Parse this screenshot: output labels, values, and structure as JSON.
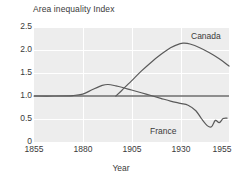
{
  "chart_data": {
    "type": "line",
    "title": "Area inequality Index",
    "xlabel": "Year",
    "ylabel": "Area inequality Index",
    "xlim": [
      1855,
      1955
    ],
    "ylim": [
      0,
      2.5
    ],
    "grid": true,
    "legend_position": "inline-labels",
    "xticks": [
      "1855",
      "1880",
      "1905",
      "1930",
      "1955"
    ],
    "yticks": [
      "2.5",
      "2.0",
      "1.5",
      "1.0",
      "0.5",
      "0"
    ],
    "reference_line": {
      "value": 1.0,
      "label": "1.0"
    },
    "series": [
      {
        "name": "Canada",
        "x": [
          1897,
          1900,
          1905,
          1910,
          1915,
          1920,
          1925,
          1930,
          1932,
          1935,
          1940,
          1945,
          1950,
          1955
        ],
        "values": [
          1.0,
          1.12,
          1.33,
          1.54,
          1.73,
          1.9,
          2.05,
          2.14,
          2.15,
          2.13,
          2.05,
          1.94,
          1.81,
          1.65
        ]
      },
      {
        "name": "France",
        "x": [
          1855,
          1865,
          1875,
          1880,
          1885,
          1890,
          1893,
          1897,
          1900,
          1905,
          1910,
          1915,
          1920,
          1925,
          1930,
          1934,
          1938,
          1941,
          1944,
          1946,
          1948,
          1950,
          1952,
          1954
        ],
        "values": [
          1.0,
          1.0,
          1.01,
          1.04,
          1.14,
          1.23,
          1.25,
          1.22,
          1.19,
          1.13,
          1.07,
          1.01,
          0.95,
          0.89,
          0.84,
          0.8,
          0.68,
          0.5,
          0.35,
          0.33,
          0.47,
          0.42,
          0.51,
          0.52
        ]
      }
    ]
  },
  "axis": {
    "ytick_positions": [
      27,
      50,
      73,
      96,
      119,
      142
    ],
    "xtick_positions": [
      34,
      83,
      132,
      181,
      229
    ]
  },
  "labels": {
    "canada": "Canada",
    "france": "France"
  }
}
